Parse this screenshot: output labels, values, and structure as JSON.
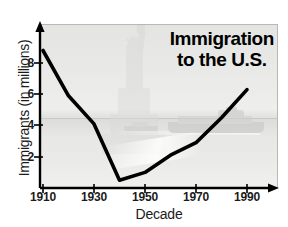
{
  "chart_data": {
    "type": "line",
    "title": "Immigration to the U.S.",
    "title_line1": "Immigration",
    "title_line2": "to the U.S.",
    "xlabel": "Decade",
    "ylabel": "Immigrants (in millions)",
    "x": [
      1910,
      1920,
      1930,
      1940,
      1950,
      1960,
      1970,
      1980,
      1990
    ],
    "values": [
      8.8,
      5.9,
      4.1,
      0.5,
      1.0,
      2.1,
      2.9,
      4.5,
      6.3
    ],
    "series": [
      {
        "name": "Immigrants (in millions)",
        "values": [
          8.8,
          5.9,
          4.1,
          0.5,
          1.0,
          2.1,
          2.9,
          4.5,
          6.3
        ]
      }
    ],
    "xtick_labels": [
      "1910",
      "1930",
      "1950",
      "1970",
      "1990"
    ],
    "xtick_values": [
      1910,
      1930,
      1950,
      1970,
      1990
    ],
    "ytick_labels": [
      "2",
      "4",
      "6",
      "8"
    ],
    "ytick_values": [
      2,
      4,
      6,
      8
    ],
    "xlim": [
      1910,
      2000
    ],
    "ylim": [
      0,
      9.7
    ],
    "grid": false,
    "legend": "none",
    "line_color": "#000000",
    "plot_background_color": "#eaeae8",
    "background_art": [
      "statue-of-liberty",
      "cruise-ship",
      "harbor-water"
    ]
  }
}
